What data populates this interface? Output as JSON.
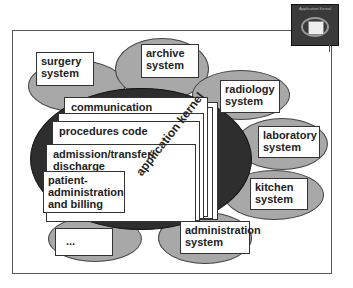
{
  "icon": {
    "title": "Application Kernel"
  },
  "systems": {
    "surgery": "surgery system",
    "archive": "archive system",
    "radiology": "radiology system",
    "laboratory": "laboratory system",
    "kitchen": "kitchen system",
    "administration": "administration system",
    "other": "..."
  },
  "kernel": {
    "label": "application kernel",
    "layers": {
      "communication": "communication",
      "procedures": "procedures code",
      "admission": "admission/transfer/ discharge",
      "patient": "patient- administration and billing"
    }
  }
}
